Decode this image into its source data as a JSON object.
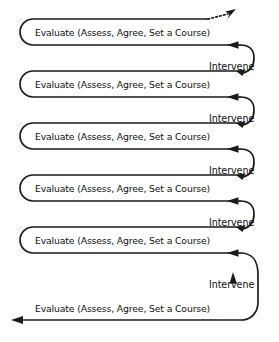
{
  "diagram": {
    "type": "cycle-flow",
    "stroke_color": "#1a1a1a",
    "background_color": "#ffffff",
    "evaluate_label": "Evaluate (Assess, Agree, Set a Course)",
    "intervene_label": "Intervene",
    "loop_count": 5,
    "baseline_count": 1,
    "connector_count": 5,
    "continuation_marker": "dashed-arrow-up-right",
    "loops": [
      {
        "index": 0,
        "label": "Evaluate (Assess, Agree, Set a Course)",
        "y_top": 25,
        "y_bottom": 51,
        "shape": "rounded-open-right"
      },
      {
        "index": 1,
        "label": "Evaluate (Assess, Agree, Set a Course)",
        "y_top": 77,
        "y_bottom": 103,
        "shape": "rounded-open-right"
      },
      {
        "index": 2,
        "label": "Evaluate (Assess, Agree, Set a Course)",
        "y_top": 129,
        "y_bottom": 155,
        "shape": "rounded-open-right"
      },
      {
        "index": 3,
        "label": "Evaluate (Assess, Agree, Set a Course)",
        "y_top": 181,
        "y_bottom": 207,
        "shape": "rounded-open-right"
      },
      {
        "index": 4,
        "label": "Evaluate (Assess, Agree, Set a Course)",
        "y_top": 233,
        "y_bottom": 259,
        "shape": "rounded-open-right"
      }
    ],
    "connectors": [
      {
        "index": 0,
        "label": "Intervene",
        "from_y": 77,
        "to_y": 51,
        "label_y": 66
      },
      {
        "index": 1,
        "label": "Intervene",
        "from_y": 129,
        "to_y": 103,
        "label_y": 118
      },
      {
        "index": 2,
        "label": "Intervene",
        "from_y": 181,
        "to_y": 155,
        "label_y": 170
      },
      {
        "index": 3,
        "label": "Intervene",
        "from_y": 233,
        "to_y": 207,
        "label_y": 222
      },
      {
        "index": 4,
        "label": "Intervene",
        "from_y": 323,
        "to_y": 259,
        "label_y": 283
      }
    ],
    "baseline": {
      "label": "Evaluate (Assess, Agree, Set a Course)",
      "y_line": 323,
      "label_y": 311,
      "arrow_direction": "left",
      "arrow_x": 20
    }
  }
}
